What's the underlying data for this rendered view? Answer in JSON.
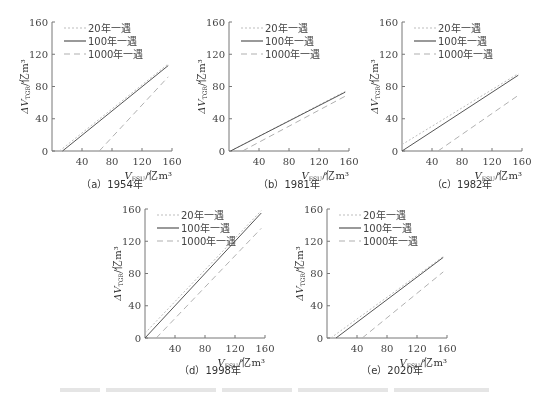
{
  "figure": {
    "caption": "",
    "caption_visible_but_illegible": true
  },
  "legend": {
    "items": [
      {
        "label": "20年一遇",
        "style": "dotted",
        "color": "#b8b8b8"
      },
      {
        "label": "100年一遇",
        "style": "solid",
        "color": "#555555"
      },
      {
        "label": "1000年一遇",
        "style": "dashed",
        "color": "#aaaaaa"
      }
    ]
  },
  "axes": {
    "ylabel": "ΔV_TGR/亿m³",
    "ylabel_main": "ΔV",
    "ylabel_sub": "TGR",
    "ylabel_unit": "/亿m³",
    "xlabel": "V_FSU/亿m³",
    "xlabel_main": "V",
    "xlabel_sub": "FSU",
    "xlabel_unit": "/亿m³",
    "xticks": [
      "40",
      "80",
      "120",
      "160"
    ],
    "yticks": [
      "0",
      "40",
      "80",
      "120",
      "160"
    ]
  },
  "panels": [
    {
      "id": "a",
      "caption": "（a）1954年"
    },
    {
      "id": "b",
      "caption": "（b）1981年"
    },
    {
      "id": "c",
      "caption": "（c）1982年"
    },
    {
      "id": "d",
      "caption": "（d）1998年"
    },
    {
      "id": "e",
      "caption": "（e）2020年"
    }
  ],
  "chart_data": [
    {
      "type": "line",
      "title": "（a）1954年",
      "xlabel": "V_FSU/亿m³",
      "ylabel": "ΔV_TGR/亿m³",
      "xlim": [
        0,
        160
      ],
      "ylim": [
        0,
        160
      ],
      "xticks": [
        40,
        80,
        120,
        160
      ],
      "yticks": [
        0,
        40,
        80,
        120,
        160
      ],
      "grid": false,
      "legend_position": "upper left",
      "series": [
        {
          "name": "20年一遇",
          "style": "dotted",
          "points": [
            [
              10,
              0
            ],
            [
              155,
              108
            ]
          ]
        },
        {
          "name": "100年一遇",
          "style": "solid",
          "points": [
            [
              14,
              0
            ],
            [
              155,
              106
            ]
          ]
        },
        {
          "name": "1000年一遇",
          "style": "dashed",
          "points": [
            [
              63,
              0
            ],
            [
              155,
              92
            ]
          ]
        }
      ]
    },
    {
      "type": "line",
      "title": "（b）1981年",
      "xlabel": "V_FSU/亿m³",
      "ylabel": "ΔV_TGR/亿m³",
      "xlim": [
        0,
        160
      ],
      "ylim": [
        0,
        160
      ],
      "xticks": [
        40,
        80,
        120,
        160
      ],
      "yticks": [
        0,
        40,
        80,
        120,
        160
      ],
      "grid": false,
      "legend_position": "upper left",
      "series": [
        {
          "name": "20年一遇",
          "style": "dotted",
          "points": [
            [
              2,
              0
            ],
            [
              155,
              74
            ]
          ]
        },
        {
          "name": "100年一遇",
          "style": "solid",
          "points": [
            [
              2,
              0
            ],
            [
              155,
              73
            ]
          ]
        },
        {
          "name": "1000年一遇",
          "style": "dashed",
          "points": [
            [
              18,
              0
            ],
            [
              155,
              68
            ]
          ]
        }
      ]
    },
    {
      "type": "line",
      "title": "（c）1982年",
      "xlabel": "V_FSU/亿m³",
      "ylabel": "ΔV_TGR/亿m³",
      "xlim": [
        0,
        160
      ],
      "ylim": [
        0,
        160
      ],
      "xticks": [
        40,
        80,
        120,
        160
      ],
      "yticks": [
        0,
        40,
        80,
        120,
        160
      ],
      "grid": false,
      "legend_position": "upper left",
      "series": [
        {
          "name": "20年一遇",
          "style": "dotted",
          "points": [
            [
              0,
              8
            ],
            [
              155,
              96
            ]
          ]
        },
        {
          "name": "100年一遇",
          "style": "solid",
          "points": [
            [
              0,
              0
            ],
            [
              155,
              94
            ]
          ]
        },
        {
          "name": "1000年一遇",
          "style": "dashed",
          "points": [
            [
              48,
              0
            ],
            [
              155,
              69
            ]
          ]
        }
      ]
    },
    {
      "type": "line",
      "title": "（d）1998年",
      "xlabel": "V_FSU/亿m³",
      "ylabel": "ΔV_TGR/亿m³",
      "xlim": [
        0,
        160
      ],
      "ylim": [
        0,
        160
      ],
      "xticks": [
        40,
        80,
        120,
        160
      ],
      "yticks": [
        0,
        40,
        80,
        120,
        160
      ],
      "grid": false,
      "legend_position": "upper left",
      "series": [
        {
          "name": "20年一遇",
          "style": "dotted",
          "points": [
            [
              0,
              6
            ],
            [
              155,
              158
            ]
          ]
        },
        {
          "name": "100年一遇",
          "style": "solid",
          "points": [
            [
              0,
              0
            ],
            [
              155,
              155
            ]
          ]
        },
        {
          "name": "1000年一遇",
          "style": "dashed",
          "points": [
            [
              15,
              0
            ],
            [
              155,
              136
            ]
          ]
        }
      ]
    },
    {
      "type": "line",
      "title": "（e）2020年",
      "xlabel": "V_FSU/亿m³",
      "ylabel": "ΔV_TGR/亿m³",
      "xlim": [
        0,
        160
      ],
      "ylim": [
        0,
        160
      ],
      "xticks": [
        40,
        80,
        120,
        160
      ],
      "yticks": [
        0,
        40,
        80,
        120,
        160
      ],
      "grid": false,
      "legend_position": "upper left",
      "series": [
        {
          "name": "20年一遇",
          "style": "dotted",
          "points": [
            [
              5,
              0
            ],
            [
              155,
              101
            ]
          ]
        },
        {
          "name": "100年一遇",
          "style": "solid",
          "points": [
            [
              12,
              0
            ],
            [
              155,
              100
            ]
          ]
        },
        {
          "name": "1000年一遇",
          "style": "dashed",
          "points": [
            [
              47,
              0
            ],
            [
              155,
              82
            ]
          ]
        }
      ]
    }
  ]
}
